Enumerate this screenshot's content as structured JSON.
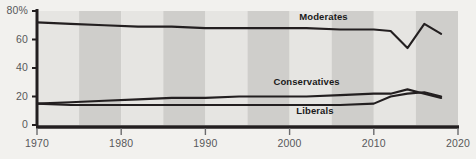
{
  "chart_data": {
    "type": "line",
    "title": "",
    "subtitle": "",
    "xlabel": "",
    "ylabel": "",
    "xlim": [
      1970,
      2020
    ],
    "ylim": [
      0,
      80
    ],
    "grid": false,
    "legend_position": "inline-labels",
    "y_ticks": [
      "0",
      "20",
      "40",
      "60",
      "80%"
    ],
    "y_tick_values": [
      0,
      20,
      40,
      60,
      80
    ],
    "x_ticks": [
      "1970",
      "1980",
      "1990",
      "2000",
      "2010",
      "2020"
    ],
    "x_tick_values": [
      1970,
      1980,
      1990,
      2000,
      2010,
      2020
    ],
    "band_shading": {
      "enabled": true,
      "interval_years": 5,
      "light_color": "#e6e5e2",
      "dark_color": "#cfcecb"
    },
    "line_color": "#231f20",
    "axis_color": "#231f20",
    "background_color": "#f2f1ee",
    "series": [
      {
        "name": "Moderates",
        "label": "Moderates",
        "label_x": 2004,
        "label_y": 76,
        "color": "#231f20",
        "x": [
          1970,
          1974,
          1978,
          1982,
          1986,
          1990,
          1994,
          1998,
          2002,
          2006,
          2010,
          2012,
          2014,
          2016,
          2018
        ],
        "values": [
          72,
          71,
          70,
          69,
          69,
          68,
          68,
          68,
          68,
          67,
          67,
          66,
          54,
          71,
          64
        ]
      },
      {
        "name": "Conservatives",
        "label": "Conservatives",
        "label_x": 2002,
        "label_y": 30,
        "color": "#231f20",
        "x": [
          1970,
          1974,
          1978,
          1982,
          1986,
          1990,
          1994,
          1998,
          2002,
          2006,
          2010,
          2012,
          2014,
          2016,
          2018
        ],
        "values": [
          15,
          16,
          17,
          18,
          19,
          19,
          20,
          20,
          20,
          21,
          22,
          22,
          25,
          22,
          19
        ]
      },
      {
        "name": "Liberals",
        "label": "Liberals",
        "label_x": 2003,
        "label_y": 10,
        "color": "#231f20",
        "x": [
          1970,
          1974,
          1978,
          1982,
          1986,
          1990,
          1994,
          1998,
          2002,
          2006,
          2010,
          2012,
          2014,
          2016,
          2018
        ],
        "values": [
          15,
          14,
          14,
          14,
          14,
          14,
          14,
          14,
          14,
          14,
          15,
          20,
          22,
          23,
          20
        ]
      }
    ]
  }
}
